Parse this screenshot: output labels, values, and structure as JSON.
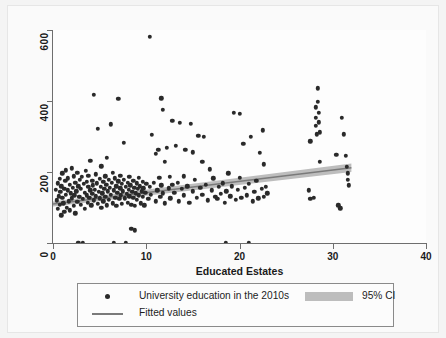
{
  "chart_data": {
    "type": "scatter",
    "title": "",
    "xlabel": "Educated Estates",
    "ylabel": "",
    "xlim": [
      0,
      40
    ],
    "ylim": [
      0,
      600
    ],
    "xticks": [
      0,
      10,
      20,
      30,
      40
    ],
    "yticks": [
      0,
      200,
      400,
      600
    ],
    "xtick_labels": [
      "0",
      "10",
      "20",
      "30",
      "40"
    ],
    "ytick_labels": [
      "0",
      "200",
      "400",
      "600"
    ],
    "grid": false,
    "legend_position": "below",
    "legend": [
      {
        "key": "points",
        "label": "University education in the 2010s",
        "marker": "circle",
        "color": "#2a2a2a"
      },
      {
        "key": "fit",
        "label": "Fitted values",
        "marker": "line",
        "color": "#7a7a7a"
      },
      {
        "key": "ci",
        "label": "95% CI",
        "marker": "band",
        "color": "#bdbdbd"
      }
    ],
    "series": [
      {
        "name": "University education in the 2010s",
        "type": "scatter",
        "color": "#2a2a2a",
        "points": [
          [
            0.3,
            150
          ],
          [
            0.4,
            120
          ],
          [
            0.5,
            168
          ],
          [
            0.5,
            96
          ],
          [
            0.6,
            132
          ],
          [
            0.7,
            180
          ],
          [
            0.7,
            108
          ],
          [
            0.8,
            145
          ],
          [
            0.9,
            160
          ],
          [
            0.9,
            78
          ],
          [
            1.0,
            128
          ],
          [
            1.0,
            196
          ],
          [
            1.1,
            112
          ],
          [
            1.2,
            152
          ],
          [
            1.2,
            88
          ],
          [
            1.3,
            175
          ],
          [
            1.4,
            136
          ],
          [
            1.4,
            205
          ],
          [
            1.5,
            100
          ],
          [
            1.6,
            148
          ],
          [
            1.6,
            182
          ],
          [
            1.7,
            118
          ],
          [
            1.8,
            164
          ],
          [
            1.8,
            92
          ],
          [
            1.9,
            140
          ],
          [
            2.0,
            210
          ],
          [
            2.0,
            126
          ],
          [
            2.1,
            156
          ],
          [
            2.2,
            104
          ],
          [
            2.2,
            188
          ],
          [
            2.3,
            134
          ],
          [
            2.4,
            170
          ],
          [
            2.4,
            84
          ],
          [
            2.5,
            146
          ],
          [
            2.6,
            198
          ],
          [
            2.6,
            116
          ],
          [
            2.7,
            160
          ],
          [
            2.7,
            0
          ],
          [
            2.8,
            130
          ],
          [
            2.9,
            178
          ],
          [
            3.0,
            108
          ],
          [
            3.0,
            152
          ],
          [
            3.1,
            186
          ],
          [
            3.2,
            0
          ],
          [
            3.2,
            124
          ],
          [
            3.3,
            166
          ],
          [
            3.4,
            142
          ],
          [
            3.4,
            96
          ],
          [
            3.5,
            204
          ],
          [
            3.6,
            134
          ],
          [
            3.6,
            172
          ],
          [
            3.7,
            114
          ],
          [
            3.8,
            158
          ],
          [
            3.8,
            190
          ],
          [
            3.9,
            128
          ],
          [
            4.0,
            148
          ],
          [
            4.0,
            232
          ],
          [
            4.1,
            106
          ],
          [
            4.2,
            176
          ],
          [
            4.2,
            138
          ],
          [
            4.3,
            162
          ],
          [
            4.4,
            120
          ],
          [
            4.4,
            418
          ],
          [
            4.5,
            150
          ],
          [
            4.6,
            194
          ],
          [
            4.6,
            132
          ],
          [
            4.7,
            168
          ],
          [
            4.8,
            110
          ],
          [
            4.8,
            322
          ],
          [
            4.9,
            144
          ],
          [
            5.0,
            180
          ],
          [
            5.0,
            126
          ],
          [
            5.1,
            158
          ],
          [
            5.2,
            100
          ],
          [
            5.2,
            216
          ],
          [
            5.3,
            140
          ],
          [
            5.4,
            172
          ],
          [
            5.4,
            118
          ],
          [
            5.5,
            152
          ],
          [
            5.6,
            188
          ],
          [
            5.6,
            130
          ],
          [
            5.7,
            164
          ],
          [
            5.8,
            106
          ],
          [
            5.8,
            240
          ],
          [
            5.9,
            146
          ],
          [
            6.0,
            178
          ],
          [
            6.0,
            122
          ],
          [
            6.1,
            156
          ],
          [
            6.2,
            334
          ],
          [
            6.2,
            136
          ],
          [
            6.3,
            170
          ],
          [
            6.4,
            112
          ],
          [
            6.4,
            198
          ],
          [
            6.5,
            148
          ],
          [
            6.5,
            0
          ],
          [
            6.6,
            182
          ],
          [
            6.7,
            128
          ],
          [
            6.8,
            160
          ],
          [
            6.8,
            104
          ],
          [
            6.9,
            142
          ],
          [
            7.0,
            406
          ],
          [
            7.0,
            174
          ],
          [
            7.1,
            124
          ],
          [
            7.2,
            154
          ],
          [
            7.2,
            190
          ],
          [
            7.3,
            134
          ],
          [
            7.4,
            166
          ],
          [
            7.4,
            110
          ],
          [
            7.5,
            146
          ],
          [
            7.6,
            282
          ],
          [
            7.6,
            178
          ],
          [
            7.7,
            126
          ],
          [
            7.8,
            0
          ],
          [
            7.8,
            158
          ],
          [
            7.9,
            138
          ],
          [
            8.0,
            170
          ],
          [
            8.0,
            114
          ],
          [
            8.1,
            150
          ],
          [
            8.2,
            186
          ],
          [
            8.2,
            132
          ],
          [
            8.3,
            162
          ],
          [
            8.4,
            108
          ],
          [
            8.4,
            40
          ],
          [
            8.5,
            144
          ],
          [
            8.6,
            176
          ],
          [
            8.6,
            128
          ],
          [
            8.7,
            156
          ],
          [
            8.8,
            104
          ],
          [
            8.8,
            36
          ],
          [
            8.9,
            140
          ],
          [
            9.0,
            168
          ],
          [
            9.0,
            122
          ],
          [
            9.1,
            152
          ],
          [
            9.2,
            184
          ],
          [
            9.2,
            134
          ],
          [
            9.3,
            160
          ],
          [
            9.4,
            112
          ],
          [
            9.5,
            146
          ],
          [
            9.6,
            172
          ],
          [
            9.6,
            130
          ],
          [
            9.7,
            154
          ],
          [
            9.8,
            106
          ],
          [
            9.9,
            142
          ],
          [
            10.0,
            166
          ],
          [
            10.2,
            124
          ],
          [
            10.4,
            580
          ],
          [
            10.4,
            158
          ],
          [
            10.5,
            136
          ],
          [
            10.6,
            304
          ],
          [
            10.8,
            170
          ],
          [
            11.0,
            118
          ],
          [
            11.0,
            252
          ],
          [
            11.2,
            148
          ],
          [
            11.3,
            262
          ],
          [
            11.4,
            184
          ],
          [
            11.5,
            130
          ],
          [
            11.6,
            408
          ],
          [
            11.6,
            162
          ],
          [
            11.8,
            376
          ],
          [
            11.8,
            140
          ],
          [
            12.0,
            112
          ],
          [
            12.0,
            228
          ],
          [
            12.2,
            268
          ],
          [
            12.4,
            154
          ],
          [
            12.5,
            186
          ],
          [
            12.6,
            126
          ],
          [
            12.8,
            344
          ],
          [
            12.8,
            164
          ],
          [
            13.0,
            142
          ],
          [
            13.2,
            274
          ],
          [
            13.4,
            170
          ],
          [
            13.5,
            118
          ],
          [
            13.6,
            338
          ],
          [
            13.8,
            152
          ],
          [
            14.0,
            188
          ],
          [
            14.0,
            134
          ],
          [
            14.2,
            262
          ],
          [
            14.4,
            160
          ],
          [
            14.6,
            114
          ],
          [
            14.8,
            336
          ],
          [
            15.0,
            146
          ],
          [
            15.0,
            256
          ],
          [
            15.2,
            178
          ],
          [
            15.4,
            128
          ],
          [
            15.6,
            302
          ],
          [
            15.8,
            156
          ],
          [
            16.0,
            136
          ],
          [
            16.0,
            228
          ],
          [
            16.2,
            300
          ],
          [
            16.4,
            164
          ],
          [
            16.6,
            120
          ],
          [
            16.8,
            208
          ],
          [
            17.0,
            148
          ],
          [
            17.2,
            182
          ],
          [
            17.4,
            130
          ],
          [
            17.6,
            124
          ],
          [
            17.8,
            158
          ],
          [
            18.0,
            138
          ],
          [
            18.2,
            168
          ],
          [
            18.4,
            114
          ],
          [
            18.5,
            0
          ],
          [
            18.6,
            146
          ],
          [
            18.8,
            196
          ],
          [
            19.0,
            132
          ],
          [
            19.2,
            160
          ],
          [
            19.4,
            366
          ],
          [
            19.6,
            122
          ],
          [
            19.8,
            150
          ],
          [
            20.0,
            184
          ],
          [
            20.0,
            364
          ],
          [
            20.2,
            128
          ],
          [
            20.4,
            280
          ],
          [
            20.6,
            156
          ],
          [
            20.8,
            134
          ],
          [
            21.0,
            0
          ],
          [
            21.0,
            166
          ],
          [
            21.2,
            300
          ],
          [
            21.4,
            118
          ],
          [
            21.6,
            144
          ],
          [
            21.8,
            176
          ],
          [
            22.0,
            126
          ],
          [
            22.2,
            254
          ],
          [
            22.4,
            152
          ],
          [
            22.5,
            318
          ],
          [
            22.6,
            130
          ],
          [
            22.6,
            222
          ],
          [
            22.8,
            158
          ],
          [
            23.0,
            140
          ],
          [
            27.4,
            148
          ],
          [
            27.6,
            124
          ],
          [
            27.6,
            286
          ],
          [
            28.0,
            128
          ],
          [
            28.2,
            382
          ],
          [
            28.2,
            352
          ],
          [
            28.2,
            330
          ],
          [
            28.3,
            306
          ],
          [
            28.4,
            436
          ],
          [
            28.4,
            398
          ],
          [
            28.5,
            366
          ],
          [
            28.5,
            340
          ],
          [
            28.6,
            312
          ],
          [
            28.6,
            228
          ],
          [
            30.4,
            248
          ],
          [
            30.6,
            106
          ],
          [
            30.8,
            98
          ],
          [
            31.0,
            352
          ],
          [
            31.2,
            306
          ],
          [
            31.4,
            246
          ],
          [
            31.5,
            214
          ],
          [
            31.6,
            196
          ],
          [
            31.6,
            178
          ],
          [
            31.7,
            162
          ]
        ]
      },
      {
        "name": "Fitted values",
        "type": "line",
        "color": "#7a7a7a",
        "x": [
          0,
          32
        ],
        "y": [
          110,
          212
        ]
      },
      {
        "name": "95% CI",
        "type": "band",
        "color": "#bdbdbd",
        "x": [
          0,
          32
        ],
        "y_lower": [
          103,
          200
        ],
        "y_upper": [
          117,
          224
        ]
      }
    ]
  },
  "axes": {
    "x_title": "Educated Estates",
    "x_tick_labels": [
      "0",
      "10",
      "20",
      "30",
      "40"
    ],
    "y_tick_labels": [
      "0",
      "200",
      "400",
      "600"
    ]
  },
  "legend": {
    "points_label": "University education in the 2010s",
    "fit_label": "Fitted values",
    "ci_label": "95% CI"
  }
}
